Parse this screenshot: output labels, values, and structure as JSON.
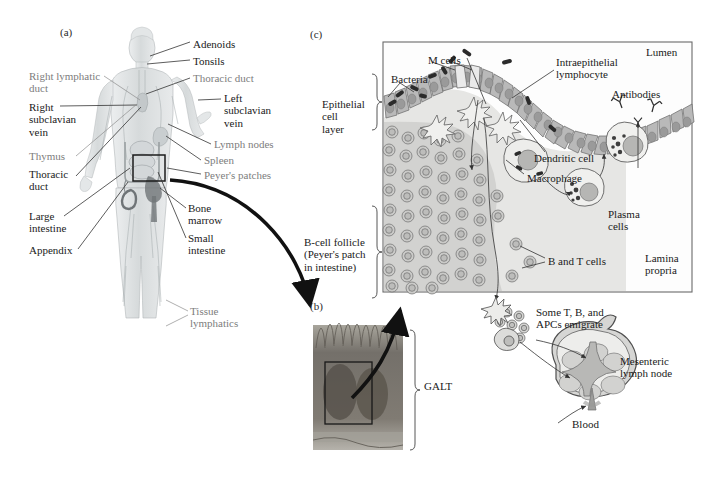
{
  "figure": {
    "background_color": "#ffffff",
    "width": 704,
    "height": 480
  },
  "panels": [
    {
      "tag": "(a)",
      "name": "human-lymphatic-system",
      "x": 60,
      "y": 26
    },
    {
      "tag": "(b)",
      "name": "peyers-patch-micrograph",
      "x": 310,
      "y": 300
    },
    {
      "tag": "(c)",
      "name": "mucosal-immune-detail",
      "x": 310,
      "y": 28
    }
  ],
  "panel_a": {
    "tag": "(a)",
    "labels": [
      {
        "text": "Adenoids",
        "style": "dark",
        "x": 193,
        "y": 38,
        "align": "left"
      },
      {
        "text": "Tonsils",
        "style": "dark",
        "x": 193,
        "y": 57,
        "align": "left"
      },
      {
        "text": "Thoracic duct",
        "style": "gray",
        "x": 193,
        "y": 74,
        "align": "left"
      },
      {
        "text": "Left\nsubclavian\nvein",
        "style": "dark",
        "x": 224,
        "y": 94,
        "align": "left"
      },
      {
        "text": "Lymph nodes",
        "style": "gray",
        "x": 214,
        "y": 140,
        "align": "left"
      },
      {
        "text": "Spleen",
        "style": "gray",
        "x": 204,
        "y": 157,
        "align": "left"
      },
      {
        "text": "Peyer's patches",
        "style": "gray",
        "x": 204,
        "y": 171,
        "align": "left"
      },
      {
        "text": "Bone\nmarrow",
        "style": "dark",
        "x": 188,
        "y": 205,
        "align": "left"
      },
      {
        "text": "Small\nintestine",
        "style": "dark",
        "x": 188,
        "y": 235,
        "align": "left"
      },
      {
        "text": "Tissue\nlymphatics",
        "style": "gray",
        "x": 190,
        "y": 308,
        "align": "left"
      },
      {
        "text": "Right lymphatic\nduct",
        "style": "gray",
        "x": 29,
        "y": 72,
        "align": "left"
      },
      {
        "text": "Right\nsubclavian\nvein",
        "style": "dark",
        "x": 29,
        "y": 103,
        "align": "left"
      },
      {
        "text": "Thymus",
        "style": "gray",
        "x": 29,
        "y": 153,
        "align": "left"
      },
      {
        "text": "Thoracic\nduct",
        "style": "dark",
        "x": 29,
        "y": 172,
        "align": "left"
      },
      {
        "text": "Large\nintestine",
        "style": "dark",
        "x": 29,
        "y": 213,
        "align": "left"
      },
      {
        "text": "Appendix",
        "style": "dark",
        "x": 29,
        "y": 247,
        "align": "left"
      }
    ],
    "highlight_box": {
      "x": 133,
      "y": 155,
      "width": 32,
      "height": 26
    }
  },
  "panel_b": {
    "tag": "(b)",
    "caption": "GALT",
    "micrograph": {
      "x": 313,
      "y": 325,
      "width": 90,
      "height": 125
    },
    "inset_box": {
      "x": 325,
      "y": 362,
      "width": 47,
      "height": 62
    }
  },
  "panel_c": {
    "tag": "(c)",
    "box": {
      "x": 383,
      "y": 42,
      "width": 309,
      "height": 250
    },
    "labels": [
      {
        "text": "Lumen",
        "name": "lumen-label",
        "x": 646,
        "y": 48,
        "style": "dark"
      },
      {
        "text": "M cells",
        "name": "m-cells-label",
        "x": 428,
        "y": 56,
        "style": "dark"
      },
      {
        "text": "Intraepithelial\nlymphocyte",
        "name": "intraepithelial-lymphocyte-label",
        "x": 556,
        "y": 60,
        "style": "dark"
      },
      {
        "text": "Antibodies",
        "name": "antibodies-label",
        "x": 612,
        "y": 90,
        "style": "dark"
      },
      {
        "text": "Bacteria",
        "name": "bacteria-label",
        "x": 393,
        "y": 77,
        "style": "dark"
      },
      {
        "text": "Epithelial\ncell\nlayer",
        "name": "epithelial-cell-layer-label",
        "x": 324,
        "y": 103,
        "style": "dark"
      },
      {
        "text": "Dendritic cell",
        "name": "dendritic-cell-label",
        "x": 534,
        "y": 155,
        "style": "dark"
      },
      {
        "text": "Macrophage",
        "name": "macrophage-label",
        "x": 527,
        "y": 175,
        "style": "dark"
      },
      {
        "text": "Plasma\ncells",
        "name": "plasma-cells-label",
        "x": 608,
        "y": 212,
        "style": "dark"
      },
      {
        "text": "B-cell follicle\n(Peyer's patch\nin intestine)",
        "name": "b-cell-follicle-label",
        "x": 306,
        "y": 240,
        "style": "dark"
      },
      {
        "text": "B and T cells",
        "name": "b-and-t-cells-label",
        "x": 548,
        "y": 258,
        "style": "dark"
      },
      {
        "text": "Lamina\npropria",
        "name": "lamina-propria-label",
        "x": 645,
        "y": 255,
        "style": "dark"
      }
    ]
  },
  "panel_d": {
    "emigrate_label": "Some T, B, and\nAPCs emigrate",
    "node_label": "Mesenteric\nlymph node",
    "blood_label": "Blood"
  },
  "colors": {
    "epithelium_fill": "#b9b9b9",
    "epithelium_nucleus": "#9a9a9a",
    "lamina_fill": "#e3e3e1",
    "follicle_fill": "#cfcfcd",
    "cell_outline": "#6e6e6e",
    "bacteria": "#2b2b2b",
    "box_border": "#555555",
    "body_tint": "#d9dcdd",
    "micrograph_tint": "#8e8c86",
    "text_dark": "#1a1a1a",
    "text_gray": "#7d7d7d"
  }
}
